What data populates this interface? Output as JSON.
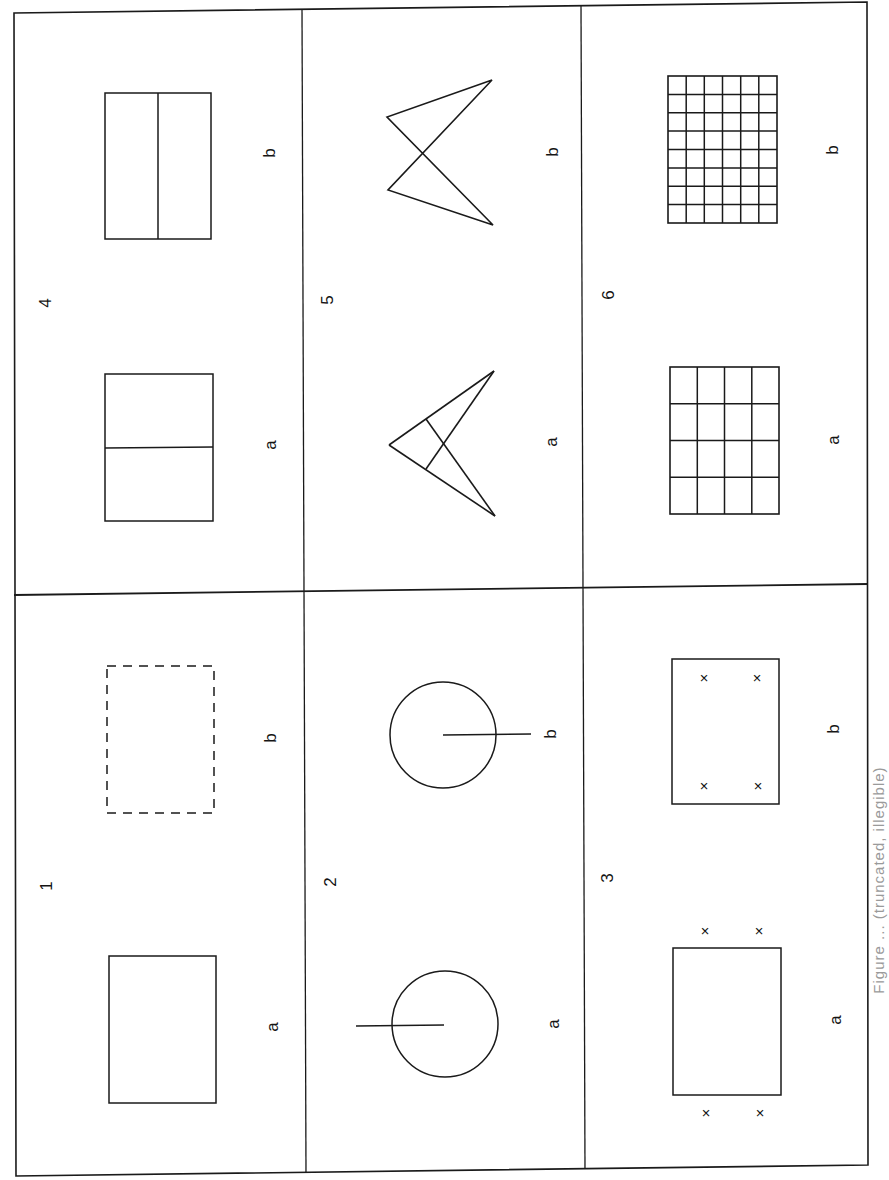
{
  "figure": {
    "orientation": "page rotated 90 degrees counter-clockwise",
    "stroke_color": "#1a1a1a",
    "background": "#ffffff",
    "caption": "Figure ... (truncated, illegible)",
    "panels": [
      {
        "number": "1",
        "number_label": "1",
        "a": {
          "label": "a",
          "shape": "solid rectangle"
        },
        "b": {
          "label": "b",
          "shape": "dashed rectangle"
        }
      },
      {
        "number": "2",
        "number_label": "2",
        "a": {
          "label": "a",
          "shape": "circle with radius line extending outward left"
        },
        "b": {
          "label": "b",
          "shape": "circle with radius line extending outward right"
        }
      },
      {
        "number": "3",
        "number_label": "3",
        "a": {
          "label": "a",
          "shape": "rectangle with four x marks outside corners"
        },
        "b": {
          "label": "b",
          "shape": "rectangle with four x marks inside corners"
        }
      },
      {
        "number": "4",
        "number_label": "4",
        "a": {
          "label": "a",
          "shape": "rectangle divided by a horizontal line"
        },
        "b": {
          "label": "b",
          "shape": "rectangle divided by a vertical line"
        }
      },
      {
        "number": "5",
        "number_label": "5",
        "a": {
          "label": "a",
          "shape": "arrowhead with internal crossing lines"
        },
        "b": {
          "label": "b",
          "shape": "crossed zigzag (bowtie) figure"
        }
      },
      {
        "number": "6",
        "number_label": "6",
        "a": {
          "label": "a",
          "shape": "grid 4 columns x 4 rows"
        },
        "b": {
          "label": "b",
          "shape": "grid 6 columns x 8 rows"
        }
      }
    ]
  },
  "labels": {
    "n1": "1",
    "n2": "2",
    "n3": "3",
    "n4": "4",
    "n5": "5",
    "n6": "6",
    "a": "a",
    "b": "b"
  }
}
